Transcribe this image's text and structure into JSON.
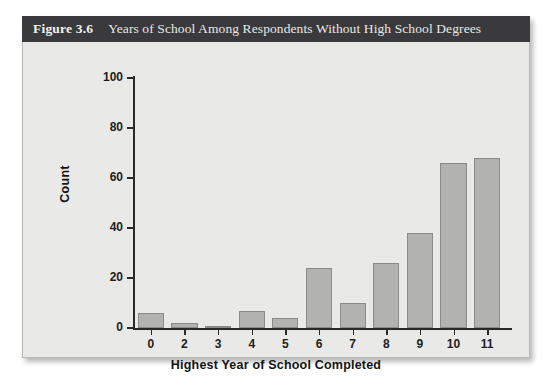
{
  "figure": {
    "number": "Figure 3.6",
    "title": "Years of School Among Respondents Without High School Degrees"
  },
  "colors": {
    "caption_bar": "#3a3a3c",
    "caption_text": "#f0efec",
    "panel_background": "#e9e9e7",
    "bar_fill": "#b2b2b0",
    "bar_border": "#8a8a88",
    "axis": "#2a2a2a"
  },
  "chart_data": {
    "type": "bar",
    "title": "Years of School Among Respondents Without High School Degrees",
    "xlabel": "Highest Year of School Completed",
    "ylabel": "Count",
    "categories": [
      "0",
      "2",
      "3",
      "4",
      "5",
      "6",
      "7",
      "8",
      "9",
      "10",
      "11"
    ],
    "values": [
      6,
      2,
      1,
      7,
      4,
      24,
      10,
      26,
      38,
      66,
      68
    ],
    "ylim": [
      0,
      100
    ],
    "yticks": [
      0,
      20,
      40,
      60,
      80,
      100
    ],
    "ytick_labels": [
      "0",
      "20",
      "40",
      "60",
      "80",
      "100"
    ],
    "xtick_labels": [
      "0",
      "2",
      "3",
      "4",
      "5",
      "6",
      "7",
      "8",
      "9",
      "10",
      "11"
    ],
    "grid": false,
    "legend": null
  }
}
